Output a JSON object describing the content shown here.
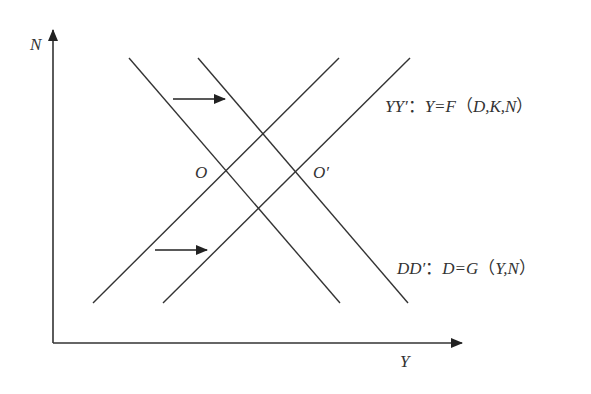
{
  "diagram": {
    "axes": {
      "y_label": "N",
      "x_label": "Y"
    },
    "points": {
      "initial": "O",
      "shifted": "O′"
    },
    "curves": {
      "yy": {
        "name": "YY′",
        "separator": "：",
        "equation_lhs": "Y=F",
        "paren_open": "（",
        "args": "D,K,N",
        "paren_close": "）"
      },
      "dd": {
        "name": "DD′",
        "separator": "：",
        "equation_lhs": "D=G",
        "paren_open": "（",
        "args": "Y,N",
        "paren_close": "）"
      }
    },
    "shift_arrows": [
      {
        "description": "DD curve shifts right",
        "direction": "right"
      },
      {
        "description": "YY curve shifts right",
        "direction": "right"
      }
    ],
    "colors": {
      "line": "#333333",
      "background": "#ffffff"
    }
  }
}
